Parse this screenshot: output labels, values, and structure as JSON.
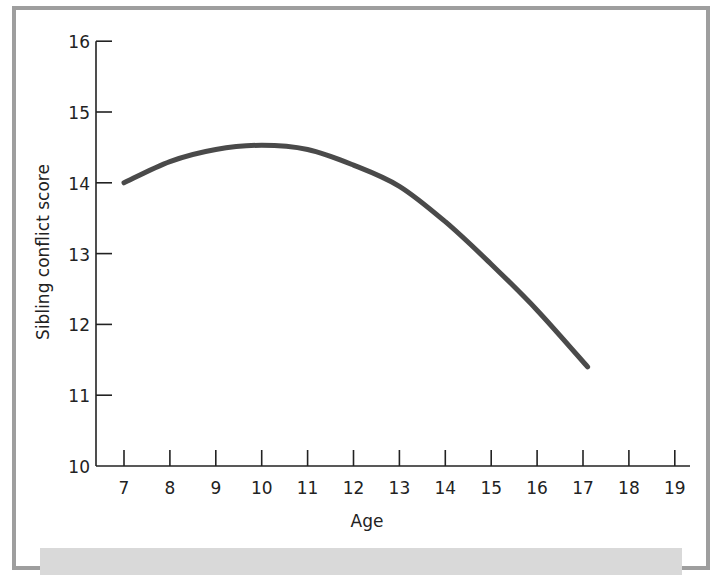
{
  "chart_data": {
    "type": "line",
    "title": "",
    "xlabel": "Age",
    "ylabel": "Sibling conflict score",
    "x_ticks": [
      7,
      8,
      9,
      10,
      11,
      12,
      13,
      14,
      15,
      16,
      17,
      18,
      19
    ],
    "y_ticks": [
      10,
      11,
      12,
      13,
      14,
      15,
      16
    ],
    "xlim": [
      6.4,
      19.4
    ],
    "ylim": [
      10,
      16
    ],
    "grid": false,
    "legend": null,
    "series": [
      {
        "name": "Sibling conflict score",
        "color": "#4a4a4a",
        "x": [
          7,
          8,
          9,
          10,
          11,
          12,
          13,
          14,
          15,
          16,
          17.1
        ],
        "values": [
          14.0,
          14.3,
          14.47,
          14.53,
          14.47,
          14.25,
          13.95,
          13.45,
          12.85,
          12.2,
          11.4
        ]
      }
    ]
  },
  "labels": {
    "xlabel": "Age",
    "ylabel": "Sibling conflict score",
    "x_ticks": [
      "7",
      "8",
      "9",
      "10",
      "11",
      "12",
      "13",
      "14",
      "15",
      "16",
      "17",
      "18",
      "19"
    ],
    "y_ticks": [
      "10",
      "11",
      "12",
      "13",
      "14",
      "15",
      "16"
    ]
  }
}
